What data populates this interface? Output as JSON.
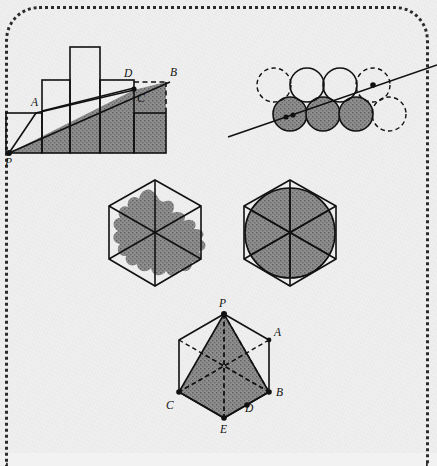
{
  "page": {
    "background_color": "#efefef",
    "frame_style": "dotted-rounded-border",
    "frame_color": "#2b2b2b",
    "ink_color": "#111111",
    "shade_color": "#808080"
  },
  "figures": [
    {
      "id": "fig-staircase",
      "name": "staircase-bars-with-secant",
      "description": "Column/bar histogram with a line from P rising through C to B; shaded triangle-like region under the line",
      "labels": [
        {
          "text": "P",
          "x": 10,
          "y": 160
        },
        {
          "text": "A",
          "x": 36,
          "y": 104
        },
        {
          "text": "C",
          "x": 139,
          "y": 101
        },
        {
          "text": "D",
          "x": 126,
          "y": 78
        },
        {
          "text": "B",
          "x": 171,
          "y": 78
        }
      ],
      "bars": [
        {
          "x": 6,
          "w": 36,
          "top": 113
        },
        {
          "x": 42,
          "w": 28,
          "top": 80
        },
        {
          "x": 70,
          "w": 30,
          "top": 47
        },
        {
          "x": 100,
          "w": 34,
          "top": 80
        },
        {
          "x": 134,
          "w": 32,
          "top": 113
        }
      ],
      "baseline_y": 153,
      "points": {
        "P": [
          9,
          153
        ],
        "C": [
          134,
          90
        ],
        "B": [
          166,
          82
        ],
        "D": [
          134,
          82
        ]
      }
    },
    {
      "id": "fig-circles",
      "name": "circle-packing-with-line",
      "description": "Two rows of four unit circles; three bottom circles shaded; a straight line crosses through two marked centers",
      "rows": 2,
      "columns": 4,
      "radius": 17,
      "dashed_circles": [
        "row1-col1",
        "row1-col4",
        "row2-col4"
      ],
      "shaded_circles": [
        "row2-col1",
        "row2-col2",
        "row2-col3"
      ],
      "marked_dots": 3
    },
    {
      "id": "fig-hexagon-blob",
      "name": "hexagon-with-irregular-blob",
      "description": "Regular hexagon with its three long diagonals and an irregular wavy shaded region centred on the middle",
      "center": [
        155,
        233
      ],
      "radius": 53
    },
    {
      "id": "fig-hexagon-circle",
      "name": "hexagon-with-inscribed-circle",
      "description": "Regular hexagon with its three long diagonals and an inscribed shaded circle",
      "center": [
        290,
        233
      ],
      "radius": 53,
      "inscribed_circle_radius": 45
    },
    {
      "id": "fig-hexagon-labeled",
      "name": "hexagon-with-labelled-kite",
      "description": "Regular hexagon with vertex P at top, shaded quadrilateral P-C-E-D and dashed diagonals",
      "center": [
        224,
        366
      ],
      "radius": 52,
      "labels": [
        {
          "text": "P",
          "x": 220,
          "y": 303
        },
        {
          "text": "A",
          "x": 270,
          "y": 333
        },
        {
          "text": "B",
          "x": 274,
          "y": 393
        },
        {
          "text": "C",
          "x": 169,
          "y": 411
        },
        {
          "text": "D",
          "x": 245,
          "y": 410
        },
        {
          "text": "E",
          "x": 219,
          "y": 428
        }
      ],
      "vertex_dots": [
        "P",
        "A",
        "B",
        "C",
        "D",
        "E"
      ]
    }
  ]
}
